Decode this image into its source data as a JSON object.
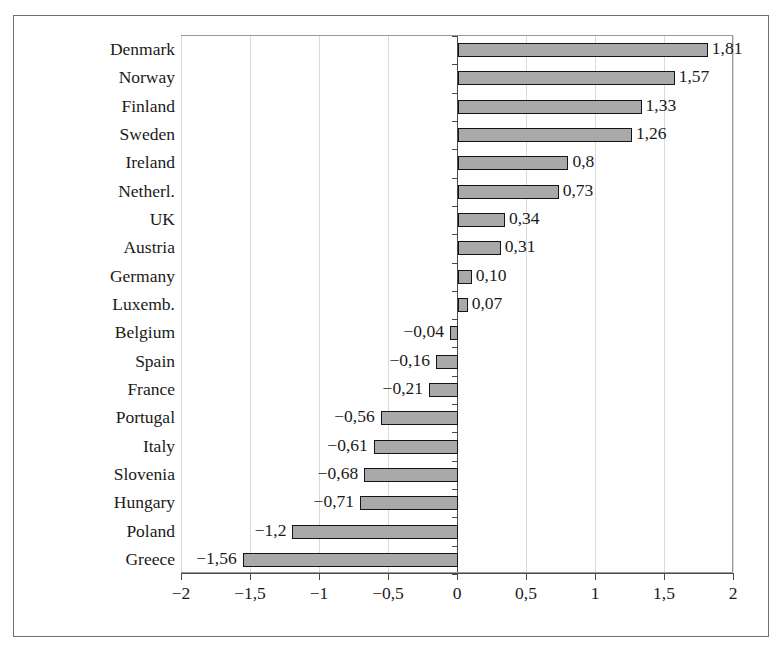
{
  "chart_data": {
    "type": "bar",
    "orientation": "horizontal",
    "title": "",
    "subtitle": "",
    "xlabel": "",
    "ylabel": "",
    "xlim": [
      -2,
      2
    ],
    "grid": true,
    "legend": null,
    "decimal_separator": ",",
    "minus_sign": "−",
    "xticks": [
      "−2",
      "−1,5",
      "−1",
      "−0,5",
      "0",
      "0,5",
      "1",
      "1,5",
      "2"
    ],
    "xtick_values": [
      -2,
      -1.5,
      -1,
      -0.5,
      0,
      0.5,
      1,
      1.5,
      2
    ],
    "categories": [
      "Denmark",
      "Norway",
      "Finland",
      "Sweden",
      "Ireland",
      "Netherl.",
      "UK",
      "Austria",
      "Germany",
      "Luxemb.",
      "Belgium",
      "Spain",
      "France",
      "Portugal",
      "Italy",
      "Slovenia",
      "Hungary",
      "Poland",
      "Greece"
    ],
    "values": [
      1.81,
      1.57,
      1.33,
      1.26,
      0.8,
      0.73,
      0.34,
      0.31,
      0.1,
      0.07,
      -0.04,
      -0.16,
      -0.21,
      -0.56,
      -0.61,
      -0.68,
      -0.71,
      -1.2,
      -1.56
    ],
    "value_labels": [
      "1,81",
      "1,57",
      "1,33",
      "1,26",
      "0,8",
      "0,73",
      "0,34",
      "0,31",
      "0,10",
      "0,07",
      "−0,04",
      "−0,16",
      "−0,21",
      "−0,56",
      "−0,61",
      "−0,68",
      "−0,71",
      "−1,2",
      "−1,56"
    ],
    "colors": {
      "bar_fill": "#a9a9a9",
      "bar_border": "#141414",
      "gridline": "#d9d9d9",
      "axis": "#4a4a4a",
      "plot_border": "#9a9a9a",
      "frame": "#6f6f6f",
      "background": "#ffffff",
      "text": "#1a1a1a"
    }
  }
}
